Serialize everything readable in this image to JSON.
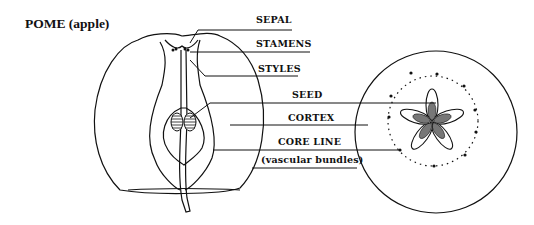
{
  "title": "POME (apple)",
  "labels": {
    "sepal": "SEPAL",
    "stamens": "STAMENS",
    "styles": "STYLES",
    "seed": "SEED",
    "cortex": "CORTEX",
    "core_line": "CORE LINE",
    "vascular": "(vascular bundles)"
  },
  "colors": {
    "line": "#111111",
    "background": "#ffffff"
  }
}
